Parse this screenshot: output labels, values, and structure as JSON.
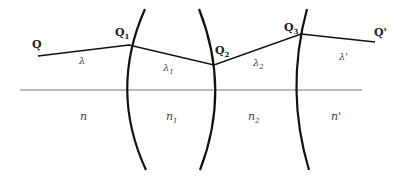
{
  "diagram": {
    "colors": {
      "stroke": "#111111",
      "axis": "#777777",
      "text": "#222222",
      "background": "#ffffff"
    },
    "axis": {
      "x1": 20,
      "y1": 90,
      "x2": 362,
      "y2": 90
    },
    "surfaces": [
      {
        "id": "surface-1",
        "path": "M145,9 Q109,90 146,170"
      },
      {
        "id": "surface-2",
        "path": "M199,9 Q231,90 200,170"
      },
      {
        "id": "surface-3",
        "path": "M307,9 Q285,90 309,170"
      }
    ],
    "ray": {
      "points": "38,56 129,45 214,65 301,34 375,42"
    },
    "points": [
      {
        "name": "Q",
        "base": "Q",
        "sub": "",
        "x": 32,
        "y": 48
      },
      {
        "name": "Q1",
        "base": "Q",
        "sub": "1",
        "x": 115,
        "y": 36
      },
      {
        "name": "Q2",
        "base": "Q",
        "sub": "2",
        "x": 215,
        "y": 54
      },
      {
        "name": "Q3",
        "base": "Q",
        "sub": "3",
        "x": 284,
        "y": 31
      },
      {
        "name": "Q'",
        "base": "Q'",
        "sub": "",
        "x": 374,
        "y": 36
      }
    ],
    "wavelengths": [
      {
        "base": "λ",
        "sub": "",
        "x": 79,
        "y": 64
      },
      {
        "base": "λ",
        "sub": "1",
        "x": 163,
        "y": 71
      },
      {
        "base": "λ",
        "sub": "2",
        "x": 253,
        "y": 66
      },
      {
        "base": "λ'",
        "sub": "",
        "x": 339,
        "y": 60
      }
    ],
    "media": [
      {
        "base": "n",
        "sub": "",
        "x": 80,
        "y": 120
      },
      {
        "base": "n",
        "sub": "1",
        "x": 166,
        "y": 120
      },
      {
        "base": "n",
        "sub": "2",
        "x": 248,
        "y": 120
      },
      {
        "base": "n'",
        "sub": "",
        "x": 331,
        "y": 120
      }
    ]
  }
}
